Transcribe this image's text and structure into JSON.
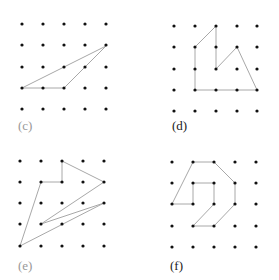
{
  "figure": {
    "line_color": "#a8a8a8",
    "dot_color": "#111111",
    "panels": [
      {
        "label": "(c)",
        "label_color": "#999999",
        "label_pos": [
          18,
          130
        ],
        "grid_x": [
          22,
          43,
          64,
          85,
          106
        ],
        "grid_y": [
          24,
          45,
          67,
          88,
          109
        ],
        "polygon": [
          [
            22,
            88
          ],
          [
            64,
            88
          ],
          [
            85,
            67
          ],
          [
            106,
            46
          ],
          [
            64,
            67
          ],
          [
            22,
            88
          ]
        ]
      },
      {
        "label": "(d)",
        "label_color": "#222222",
        "label_pos": [
          172,
          130
        ],
        "grid_x": [
          174,
          195,
          216,
          237,
          257
        ],
        "grid_y": [
          26,
          47,
          69,
          90,
          111
        ],
        "polygon": [
          [
            195,
            47
          ],
          [
            216,
            26
          ],
          [
            216,
            69
          ],
          [
            237,
            47
          ],
          [
            257,
            90
          ],
          [
            195,
            90
          ],
          [
            195,
            47
          ]
        ]
      },
      {
        "label": "(e)",
        "label_color": "#999999",
        "label_pos": [
          18,
          270
        ],
        "grid_x": [
          20,
          41,
          62,
          83,
          104
        ],
        "grid_y": [
          161,
          182,
          203,
          224,
          246
        ],
        "polygon": [
          [
            62,
            161
          ],
          [
            104,
            182
          ],
          [
            41,
            224
          ],
          [
            104,
            203
          ],
          [
            20,
            246
          ],
          [
            41,
            182
          ],
          [
            62,
            182
          ],
          [
            62,
            161
          ]
        ]
      },
      {
        "label": "(f)",
        "label_color": "#222222",
        "label_pos": [
          170,
          270
        ],
        "grid_x": [
          172,
          193,
          214,
          235,
          256
        ],
        "grid_y": [
          162,
          183,
          204,
          226,
          247
        ],
        "polygon": [
          [
            193,
            162
          ],
          [
            214,
            162
          ],
          [
            235,
            183
          ],
          [
            235,
            204
          ],
          [
            214,
            226
          ],
          [
            193,
            226
          ],
          [
            214,
            204
          ],
          [
            214,
            183
          ],
          [
            193,
            183
          ],
          [
            193,
            204
          ],
          [
            172,
            204
          ],
          [
            193,
            162
          ]
        ]
      }
    ]
  }
}
